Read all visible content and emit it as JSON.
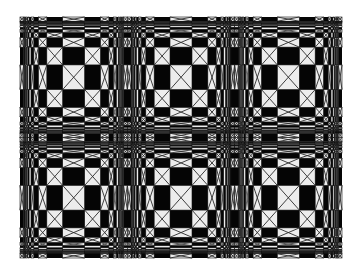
{
  "canvas": {
    "width": 359,
    "height": 274,
    "background": "#ffffff"
  },
  "artwork": {
    "title": "Bulging checkerboard op-art pattern",
    "description": "3 x 2 tiled fisheye-warped checkerboard; white cells contain an X",
    "bounds": {
      "x": 20,
      "y": 17,
      "width": 322,
      "height": 241
    },
    "tiles": {
      "columns": 3,
      "rows": 2
    },
    "cells_per_half_tile": 14,
    "warp": {
      "type": "atan",
      "scale": 1.5
    },
    "colors": {
      "dark": "#050505",
      "light": "#ededed",
      "cross_line": "#2a2a2a",
      "cell_outline": "#111111"
    },
    "cross_line_width": 0.9,
    "min_cross_cell_size": 2.2
  }
}
